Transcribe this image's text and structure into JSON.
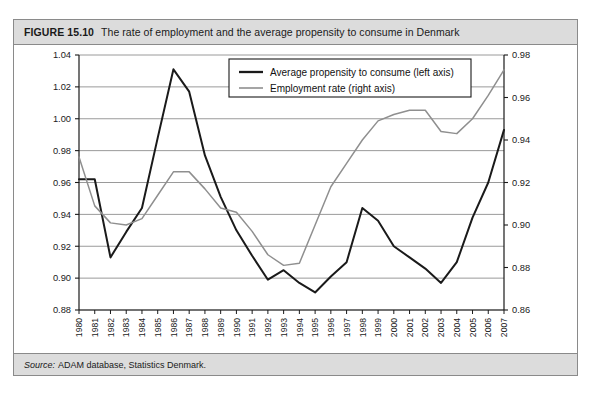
{
  "figure": {
    "number": "FIGURE 15.10",
    "title": "The rate of employment and the average propensity to consume in Denmark",
    "source_label": "Source:",
    "source_text": "ADAM database, Statistics Denmark."
  },
  "colors": {
    "header_background": "#dcdcdc",
    "border": "#8a8a8a",
    "series_apc": "#1a1a1a",
    "series_employment": "#8f8f8f",
    "gridline": "#9a9a9a",
    "plot_background": "#ffffff"
  },
  "chart_data": {
    "type": "line",
    "title": "The rate of employment and the average propensity to consume in Denmark",
    "xlabel": "",
    "ylabel": "",
    "grid": true,
    "legend_position": "top-center",
    "categories": [
      "1980",
      "1981",
      "1982",
      "1983",
      "1984",
      "1985",
      "1986",
      "1987",
      "1988",
      "1989",
      "1990",
      "1991",
      "1992",
      "1993",
      "1994",
      "1995",
      "1996",
      "1997",
      "1998",
      "1999",
      "2000",
      "2001",
      "2002",
      "2003",
      "2004",
      "2005",
      "2006",
      "2007"
    ],
    "axes": {
      "left": {
        "label": "Average propensity to consume (left axis)",
        "ylim": [
          0.88,
          1.04
        ],
        "ticks": [
          "0.88",
          "0.90",
          "0.92",
          "0.94",
          "0.96",
          "0.98",
          "1.00",
          "1.02",
          "1.04"
        ],
        "tick_values": [
          0.88,
          0.9,
          0.92,
          0.94,
          0.96,
          0.98,
          1.0,
          1.02,
          1.04
        ]
      },
      "right": {
        "label": "Employment rate (right axis)",
        "ylim": [
          0.86,
          0.98
        ],
        "ticks": [
          "0.86",
          "0.88",
          "0.90",
          "0.92",
          "0.94",
          "0.96",
          "0.98"
        ],
        "tick_values": [
          0.86,
          0.88,
          0.9,
          0.92,
          0.94,
          0.96,
          0.98
        ]
      }
    },
    "series": [
      {
        "name": "Average propensity to consume (left axis)",
        "axis": "left",
        "color": "#1a1a1a",
        "values": [
          0.962,
          0.962,
          0.913,
          0.929,
          0.944,
          0.988,
          1.031,
          1.017,
          0.977,
          0.951,
          0.93,
          0.914,
          0.899,
          0.905,
          0.897,
          0.891,
          0.901,
          0.91,
          0.944,
          0.936,
          0.92,
          0.913,
          0.906,
          0.897,
          0.91,
          0.938,
          0.96,
          0.993
        ]
      },
      {
        "name": "Employment rate (right axis)",
        "axis": "right",
        "color": "#8f8f8f",
        "values": [
          0.932,
          0.909,
          0.901,
          0.9,
          0.903,
          0.914,
          0.925,
          0.925,
          0.917,
          0.908,
          0.906,
          0.897,
          0.886,
          0.881,
          0.882,
          0.9,
          0.918,
          0.929,
          0.94,
          0.949,
          0.952,
          0.954,
          0.954,
          0.944,
          0.943,
          0.95,
          0.961,
          0.973
        ]
      }
    ]
  }
}
